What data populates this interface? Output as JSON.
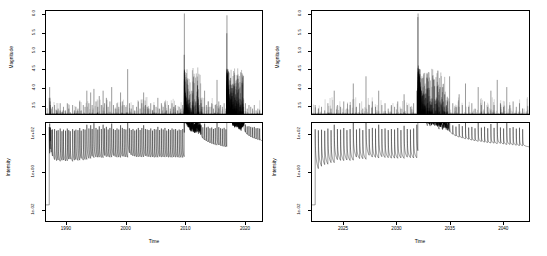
{
  "figure": {
    "background": "#ffffff",
    "line_color": "#000000",
    "width": 547,
    "height": 256
  },
  "panels": {
    "top_left": {
      "name": "magnitude-left"
    },
    "top_right": {
      "name": "magnitude-right"
    },
    "bottom_left": {
      "name": "intensity-left"
    },
    "bottom_right": {
      "name": "intensity-right"
    }
  },
  "axes": {
    "magnitude_y_title": "Magnitude",
    "intensity_y_title": "Intensity",
    "x_title": "Time",
    "magnitude_yticks": [
      "3.5",
      "4.0",
      "4.5",
      "5.0",
      "5.5",
      "6.0"
    ],
    "intensity_yticks": [
      "1e+02",
      "1e+00",
      "1e-02"
    ],
    "left_xticks": [
      "1990",
      "2000",
      "2010",
      "2020"
    ],
    "right_xticks": [
      "2025",
      "2030",
      "2035",
      "2040"
    ]
  },
  "chart_data": [
    {
      "id": "magnitude-left",
      "type": "bar",
      "title": "",
      "xlabel": "Time",
      "ylabel": "Magnitude",
      "xlim": [
        1986.5,
        2023.0
      ],
      "ylim": [
        3.25,
        6.12
      ],
      "xticks": [
        1990,
        2000,
        2010,
        2020
      ],
      "yticks": [
        3.5,
        4.0,
        4.5,
        5.0,
        5.5,
        6.0
      ],
      "grid": false,
      "legend": "none",
      "description": "Earthquake magnitudes plotted as vertical sticks from a baseline magnitude threshold of 3.25; two dense aftershock clusters near 2010 and 2017 contain the largest events (M6.0).",
      "x": [
        1987.05,
        1987.12,
        1987.2,
        1987.22,
        1987.38,
        1987.6,
        1987.95,
        1988.3,
        1988.55,
        1988.9,
        1989.2,
        1989.45,
        1989.8,
        1990.1,
        1990.35,
        1990.6,
        1991.0,
        1991.3,
        1991.55,
        1991.9,
        1992.2,
        1992.45,
        1992.8,
        1993.1,
        1993.4,
        1993.75,
        1994.05,
        1994.3,
        1994.6,
        1994.95,
        1995.25,
        1995.5,
        1995.85,
        1996.15,
        1996.4,
        1996.7,
        1997.0,
        1997.3,
        1997.6,
        1997.9,
        1998.2,
        1998.5,
        1998.8,
        1999.1,
        1999.4,
        1999.7,
        2000.0,
        2000.3,
        2000.6,
        2000.9,
        2001.2,
        2001.5,
        2001.8,
        2002.1,
        2002.4,
        2002.7,
        2003.0,
        2003.3,
        2003.6,
        2003.9,
        2004.2,
        2004.5,
        2004.8,
        2005.1,
        2005.4,
        2005.7,
        2006.0,
        2006.3,
        2006.6,
        2006.9,
        2007.2,
        2007.5,
        2007.8,
        2008.1,
        2008.4,
        2008.7,
        2009.0,
        2009.3,
        2009.6,
        2009.85,
        2009.88,
        2009.9,
        2009.92,
        2009.95,
        2009.97,
        2010.0,
        2010.02,
        2010.05,
        2010.08,
        2010.12,
        2010.18,
        2010.25,
        2010.35,
        2010.5,
        2010.7,
        2010.95,
        2011.2,
        2011.5,
        2011.8,
        2012.1,
        2012.4,
        2012.7,
        2013.0,
        2013.3,
        2013.6,
        2013.9,
        2014.2,
        2014.5,
        2014.8,
        2015.1,
        2015.4,
        2015.7,
        2016.0,
        2016.3,
        2016.6,
        2016.9,
        2017.05,
        2017.08,
        2017.1,
        2017.12,
        2017.15,
        2017.18,
        2017.2,
        2017.22,
        2017.25,
        2017.28,
        2017.32,
        2017.38,
        2017.45,
        2017.55,
        2017.7,
        2017.9,
        2018.15,
        2018.4,
        2018.7,
        2019.0,
        2019.3,
        2019.6,
        2019.9,
        2020.2,
        2020.5,
        2020.8,
        2021.1,
        2021.4,
        2021.7,
        2022.0,
        2022.3,
        2022.6
      ],
      "values": [
        3.7,
        4.0,
        3.6,
        3.5,
        3.4,
        3.45,
        3.5,
        3.35,
        3.4,
        3.55,
        3.3,
        3.45,
        3.35,
        3.55,
        3.4,
        3.3,
        3.5,
        3.35,
        3.45,
        3.4,
        3.6,
        3.35,
        3.5,
        3.45,
        3.9,
        3.55,
        3.85,
        3.5,
        3.95,
        3.6,
        3.45,
        3.75,
        3.5,
        3.9,
        3.55,
        3.7,
        3.45,
        3.6,
        4.0,
        3.5,
        3.4,
        3.55,
        3.45,
        3.85,
        3.6,
        3.5,
        3.45,
        4.5,
        3.55,
        3.4,
        3.5,
        3.35,
        3.45,
        3.6,
        3.4,
        3.55,
        3.85,
        3.5,
        3.45,
        3.4,
        3.55,
        3.35,
        3.5,
        3.45,
        3.7,
        3.4,
        3.55,
        3.45,
        3.6,
        3.35,
        3.5,
        3.4,
        3.55,
        3.45,
        3.5,
        3.35,
        3.45,
        3.4,
        3.5,
        4.9,
        6.05,
        4.2,
        4.0,
        3.8,
        3.9,
        3.7,
        3.85,
        3.6,
        3.75,
        3.55,
        3.7,
        3.5,
        3.65,
        3.45,
        3.55,
        3.4,
        3.5,
        3.45,
        3.6,
        4.05,
        3.5,
        3.55,
        3.45,
        3.9,
        3.5,
        3.6,
        3.45,
        3.55,
        3.4,
        3.5,
        4.2,
        3.6,
        3.5,
        3.45,
        3.55,
        3.4,
        5.5,
        6.0,
        4.4,
        4.2,
        4.35,
        4.1,
        4.0,
        4.15,
        3.9,
        4.05,
        3.85,
        3.95,
        3.7,
        3.8,
        3.65,
        3.75,
        3.6,
        3.7,
        3.55,
        3.65,
        3.5,
        3.6,
        3.45,
        3.55,
        3.4,
        3.5,
        3.45,
        3.4,
        3.5,
        3.35,
        3.4,
        3.35
      ]
    },
    {
      "id": "intensity-left",
      "type": "line",
      "title": "",
      "xlabel": "Time",
      "ylabel": "Intensity",
      "xlim": [
        1986.5,
        2023.0
      ],
      "ylim_log10": [
        -2.6,
        2.6
      ],
      "xticks": [
        1990,
        2000,
        2010,
        2020
      ],
      "yticks": [
        "1e-02",
        "1e+00",
        "1e+02"
      ],
      "yscale": "log",
      "grid": false,
      "legend": "none",
      "description": "ETAS conditional intensity lambda(t) on a log scale. Each earthquake produces an instantaneous jump followed by Omori-law power-law decay; the 2010 and 2017 mainshock sequences create sustained elevated intensity plateaus."
    },
    {
      "id": "magnitude-right",
      "type": "bar",
      "title": "",
      "xlabel": "Time",
      "ylabel": "Magnitude",
      "xlim": [
        2022.0,
        2042.5
      ],
      "ylim": [
        3.25,
        6.12
      ],
      "xticks": [
        2025,
        2030,
        2035,
        2040
      ],
      "yticks": [
        3.5,
        4.0,
        4.5,
        5.0,
        5.5,
        6.0
      ],
      "grid": false,
      "legend": "none",
      "description": "Simulated/forecast earthquake magnitudes. A major clustered sequence begins near 2032 with events reaching M6.0, followed by a long decaying aftershock tail through 2041.",
      "x": [
        2022.3,
        2022.6,
        2022.9,
        2023.2,
        2023.5,
        2023.8,
        2024.1,
        2024.4,
        2024.7,
        2025.0,
        2025.3,
        2025.6,
        2025.9,
        2026.2,
        2026.5,
        2026.8,
        2027.1,
        2027.4,
        2027.7,
        2028.0,
        2028.3,
        2028.6,
        2028.9,
        2029.2,
        2029.5,
        2029.8,
        2030.1,
        2030.4,
        2030.7,
        2031.0,
        2031.3,
        2031.6,
        2031.9,
        2032.0,
        2032.02,
        2032.05,
        2032.08,
        2032.1,
        2032.12,
        2032.15,
        2032.18,
        2032.2,
        2032.22,
        2032.25,
        2032.3,
        2032.35,
        2032.42,
        2032.5,
        2032.6,
        2032.75,
        2032.9,
        2033.1,
        2033.3,
        2033.5,
        2033.8,
        2034.1,
        2034.4,
        2034.7,
        2035.0,
        2035.3,
        2035.6,
        2035.9,
        2036.2,
        2036.5,
        2036.8,
        2037.1,
        2037.4,
        2037.7,
        2038.0,
        2038.3,
        2038.6,
        2038.9,
        2039.2,
        2039.5,
        2039.8,
        2040.1,
        2040.4,
        2040.7,
        2041.0,
        2041.3,
        2041.6,
        2041.9
      ],
      "values": [
        3.5,
        3.4,
        3.45,
        3.35,
        3.55,
        3.4,
        3.9,
        3.5,
        3.45,
        3.6,
        3.4,
        3.5,
        4.1,
        3.45,
        3.55,
        3.4,
        4.3,
        3.5,
        3.6,
        3.45,
        3.9,
        3.5,
        3.55,
        3.4,
        3.5,
        3.45,
        3.6,
        3.4,
        3.8,
        3.5,
        3.45,
        3.55,
        3.9,
        5.95,
        6.05,
        4.6,
        4.4,
        4.5,
        4.2,
        4.3,
        4.05,
        4.15,
        3.95,
        4.0,
        3.85,
        3.9,
        3.75,
        3.8,
        3.65,
        3.7,
        3.55,
        3.6,
        3.5,
        4.2,
        3.55,
        4.0,
        3.6,
        3.5,
        4.3,
        3.55,
        3.45,
        3.8,
        3.5,
        4.1,
        3.45,
        3.55,
        3.4,
        4.0,
        3.5,
        3.6,
        3.45,
        3.9,
        3.5,
        4.2,
        3.55,
        3.45,
        4.0,
        3.5,
        3.6,
        3.45,
        3.55,
        3.4
      ]
    },
    {
      "id": "intensity-right",
      "type": "line",
      "title": "",
      "xlabel": "Time",
      "ylabel": "Intensity",
      "xlim": [
        2022.0,
        2042.5
      ],
      "ylim_log10": [
        -2.6,
        2.6
      ],
      "xticks": [
        2025,
        2030,
        2035,
        2040
      ],
      "yticks": [
        "1e-02",
        "1e+00",
        "1e+02"
      ],
      "yscale": "log",
      "grid": false,
      "legend": "none",
      "description": "Forecast ETAS conditional intensity. Background-rate spikes dominate until the 2032 mainshock, after which the intensity stays elevated and decays slowly through the end of the window."
    }
  ]
}
